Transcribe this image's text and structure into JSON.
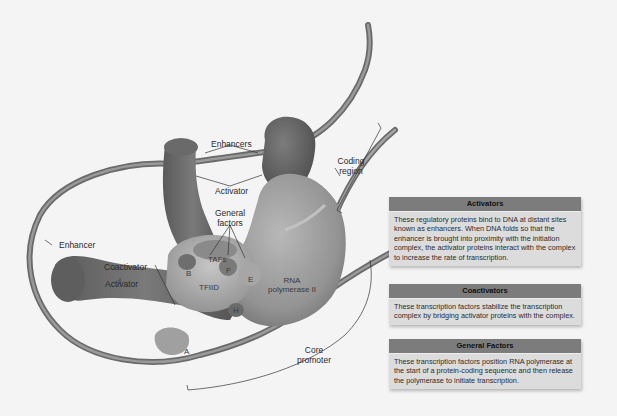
{
  "diagram": {
    "labels": {
      "enhancers": "Enhancers",
      "activator_top": "Activator",
      "coding_region_line1": "Coding",
      "coding_region_line2": "region",
      "general_factors_line1": "General",
      "general_factors_line2": "factors",
      "enhancer_left": "Enhancer",
      "coactivator": "Coactivator",
      "activator_left": "Activator",
      "tafs": "TAFs",
      "tfiid": "TFIID",
      "rna_pol_line1": "RNA",
      "rna_pol_line2": "polymerase II",
      "factor_b": "B",
      "factor_f": "F",
      "factor_e": "E",
      "factor_h": "H",
      "factor_a": "A",
      "core_promoter_line1": "Core",
      "core_promoter_line2": "promoter"
    },
    "colors": {
      "background": "#f4f4f4",
      "dna": "#7a7a7a",
      "activator": "#6a6a6a",
      "polymerase": "#9a9a9a",
      "box_header": "#7c7c7c",
      "box_body": "#dcdcdc"
    }
  },
  "info_boxes": [
    {
      "title": "Activators",
      "text": "These regulatory proteins bind to DNA at distant sites known as enhancers. When DNA folds so that the enhancer is brought into proximity with the initiation complex, the activator proteins interact with the complex to increase the rate of transcription."
    },
    {
      "title": "Coactivators",
      "text": "These transcription factors stabilize the transcription complex by bridging activator proteins with the complex."
    },
    {
      "title": "General Factors",
      "text": "These transcription factors position RNA polymerase at the start of a protein-coding sequence and then release the polymerase to initiate transcription."
    }
  ]
}
